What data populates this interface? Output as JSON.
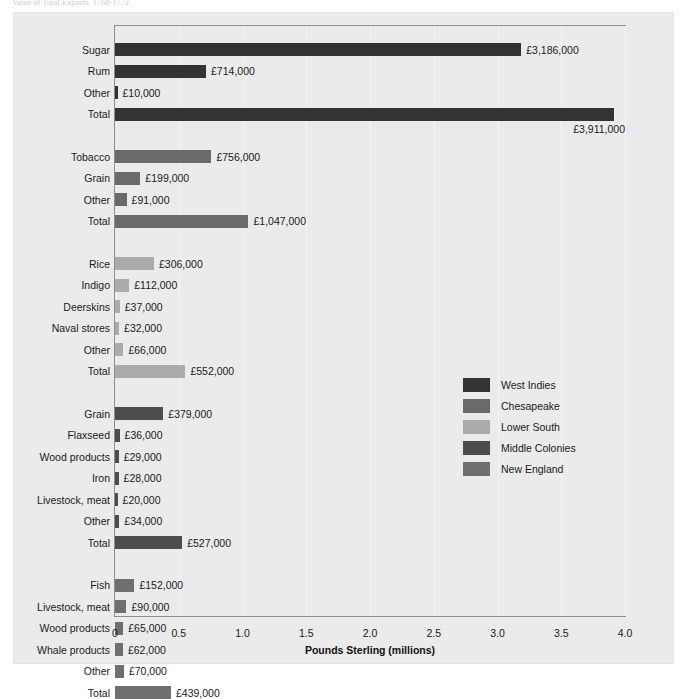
{
  "caption": "Value of Total Exports, 1768-1772",
  "chart_data": {
    "type": "bar",
    "title": "",
    "xlabel": "Pounds Sterling (millions)",
    "ylabel": "",
    "xlim": [
      0,
      4.0
    ],
    "xticks": [
      "0",
      "0.5",
      "1.0",
      "1.5",
      "2.0",
      "2.5",
      "3.0",
      "3.5",
      "4.0"
    ],
    "xtick_values": [
      0,
      0.5,
      1.0,
      1.5,
      2.0,
      2.5,
      3.0,
      3.5,
      4.0
    ],
    "grid": true,
    "legend_position": "center-right",
    "orientation": "horizontal",
    "groups": [
      {
        "name": "West Indies",
        "color": "#333333",
        "rows": [
          {
            "label": "Sugar",
            "value": 3.186,
            "value_label": "£3,186,000",
            "value_below": false
          },
          {
            "label": "Rum",
            "value": 0.714,
            "value_label": "£714,000",
            "value_below": false
          },
          {
            "label": "Other",
            "value": 0.01,
            "value_label": "£10,000",
            "value_below": false
          },
          {
            "label": "Total",
            "value": 3.911,
            "value_label": "£3,911,000",
            "value_below": true
          }
        ]
      },
      {
        "name": "Chesapeake",
        "color": "#6a6a6a",
        "rows": [
          {
            "label": "Tobacco",
            "value": 0.756,
            "value_label": "£756,000",
            "value_below": false
          },
          {
            "label": "Grain",
            "value": 0.199,
            "value_label": "£199,000",
            "value_below": false
          },
          {
            "label": "Other",
            "value": 0.091,
            "value_label": "£91,000",
            "value_below": false
          },
          {
            "label": "Total",
            "value": 1.047,
            "value_label": "£1,047,000",
            "value_below": false
          }
        ]
      },
      {
        "name": "Lower South",
        "color": "#ababab",
        "rows": [
          {
            "label": "Rice",
            "value": 0.306,
            "value_label": "£306,000",
            "value_below": false
          },
          {
            "label": "Indigo",
            "value": 0.112,
            "value_label": "£112,000",
            "value_below": false
          },
          {
            "label": "Deerskins",
            "value": 0.037,
            "value_label": "£37,000",
            "value_below": false
          },
          {
            "label": "Naval stores",
            "value": 0.032,
            "value_label": "£32,000",
            "value_below": false
          },
          {
            "label": "Other",
            "value": 0.066,
            "value_label": "£66,000",
            "value_below": false
          },
          {
            "label": "Total",
            "value": 0.552,
            "value_label": "£552,000",
            "value_below": false
          }
        ]
      },
      {
        "name": "Middle Colonies",
        "color": "#4d4d4d",
        "rows": [
          {
            "label": "Grain",
            "value": 0.379,
            "value_label": "£379,000",
            "value_below": false
          },
          {
            "label": "Flaxseed",
            "value": 0.036,
            "value_label": "£36,000",
            "value_below": false
          },
          {
            "label": "Wood products",
            "value": 0.029,
            "value_label": "£29,000",
            "value_below": false
          },
          {
            "label": "Iron",
            "value": 0.028,
            "value_label": "£28,000",
            "value_below": false
          },
          {
            "label": "Livestock, meat",
            "value": 0.02,
            "value_label": "£20,000",
            "value_below": false
          },
          {
            "label": "Other",
            "value": 0.034,
            "value_label": "£34,000",
            "value_below": false
          },
          {
            "label": "Total",
            "value": 0.527,
            "value_label": "£527,000",
            "value_below": false
          }
        ]
      },
      {
        "name": "New England",
        "color": "#6f6f6f",
        "rows": [
          {
            "label": "Fish",
            "value": 0.152,
            "value_label": "£152,000",
            "value_below": false
          },
          {
            "label": "Livestock, meat",
            "value": 0.09,
            "value_label": "£90,000",
            "value_below": false
          },
          {
            "label": "Wood products",
            "value": 0.065,
            "value_label": "£65,000",
            "value_below": false
          },
          {
            "label": "Whale products",
            "value": 0.062,
            "value_label": "£62,000",
            "value_below": false
          },
          {
            "label": "Other",
            "value": 0.07,
            "value_label": "£70,000",
            "value_below": false
          },
          {
            "label": "Total",
            "value": 0.439,
            "value_label": "£439,000",
            "value_below": false
          }
        ]
      }
    ],
    "legend": [
      {
        "label": "West Indies",
        "color": "#333333"
      },
      {
        "label": "Chesapeake",
        "color": "#6a6a6a"
      },
      {
        "label": "Lower South",
        "color": "#ababab"
      },
      {
        "label": "Middle Colonies",
        "color": "#4d4d4d"
      },
      {
        "label": "New England",
        "color": "#6f6f6f"
      }
    ]
  }
}
